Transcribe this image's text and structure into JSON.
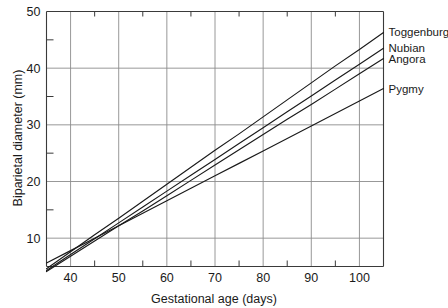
{
  "chart_data": {
    "type": "line",
    "title": "",
    "subtitle": "",
    "xlabel": "Gestational age (days)",
    "ylabel": "Biparietal diameter (mm)",
    "xlim": [
      35,
      105
    ],
    "ylim": [
      5,
      50
    ],
    "x_major_ticks": [
      40,
      50,
      60,
      70,
      80,
      90,
      100
    ],
    "x_major_tick_labels": [
      "40",
      "50",
      "60",
      "70",
      "80",
      "90",
      "100"
    ],
    "x_minor_ticks": [
      45,
      55,
      65,
      75,
      85,
      95
    ],
    "y_major_ticks": [
      10,
      20,
      30,
      40,
      50
    ],
    "y_major_tick_labels": [
      "10",
      "20",
      "30",
      "40",
      "50"
    ],
    "y_minor_ticks": [
      15,
      25,
      35,
      45
    ],
    "grid": "major-xy",
    "grid_color": "#8c8c8c",
    "frame_color": "#3a3a3a",
    "line_color": "#1a1a1a",
    "legend_position": "right-inline-labels",
    "x": [
      35,
      40,
      45,
      50,
      55,
      60,
      65,
      70,
      75,
      80,
      85,
      90,
      95,
      100,
      105
    ],
    "series": [
      {
        "name": "Toggenburg",
        "label": "Toggenburg",
        "values": [
          4.6,
          7.6,
          10.6,
          13.5,
          16.5,
          19.5,
          22.5,
          25.5,
          28.4,
          31.4,
          34.4,
          37.4,
          40.4,
          43.3,
          46.3
        ]
      },
      {
        "name": "Nubian",
        "label": "Nubian",
        "values": [
          4.3,
          7.1,
          9.9,
          12.7,
          15.5,
          18.3,
          21.1,
          23.9,
          26.7,
          29.5,
          32.3,
          35.1,
          37.9,
          40.7,
          43.5
        ]
      },
      {
        "name": "Angora",
        "label": "Angora",
        "values": [
          4.1,
          6.8,
          9.5,
          12.2,
          14.8,
          17.5,
          20.2,
          22.9,
          25.6,
          28.3,
          31.0,
          33.6,
          36.3,
          39.0,
          41.7
        ]
      },
      {
        "name": "Pygmy",
        "label": "Pygmy",
        "values": [
          5.6,
          7.8,
          10.0,
          12.2,
          14.4,
          16.6,
          18.8,
          21.0,
          23.2,
          25.4,
          27.6,
          29.8,
          32.0,
          34.2,
          36.4
        ]
      }
    ]
  }
}
